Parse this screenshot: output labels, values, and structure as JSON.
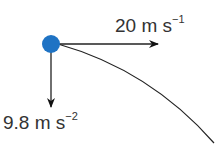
{
  "diagram": {
    "type": "projectile-motion",
    "object": {
      "name": "ball",
      "color": "#1f73c4"
    },
    "horizontal_velocity": {
      "value": "20",
      "unit": "m s",
      "exponent": "−1"
    },
    "vertical_acceleration": {
      "value": "9.8",
      "unit": "m s",
      "exponent": "−2"
    }
  }
}
